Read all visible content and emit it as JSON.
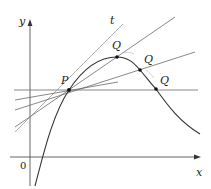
{
  "diagram": {
    "axes": {
      "x_label": "x",
      "y_label": "y",
      "origin_label": "0"
    },
    "points": {
      "P": {
        "label": "P",
        "x": 69,
        "y": 90
      },
      "Q": [
        {
          "label": "Q",
          "x": 117,
          "y": 57
        },
        {
          "label": "Q",
          "x": 140,
          "y": 70
        },
        {
          "label": "Q",
          "x": 156,
          "y": 89
        }
      ]
    },
    "tangent_label": "t",
    "colors": {
      "curve": "#333333",
      "lines": "#666666",
      "axes": "#555555",
      "text": "#222222",
      "background": "#ffffff"
    }
  }
}
